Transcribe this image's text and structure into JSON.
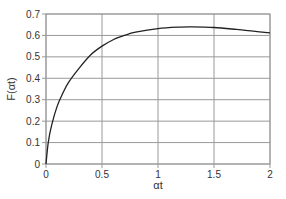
{
  "chart_data": {
    "type": "line",
    "title": "",
    "xlabel": "αt",
    "ylabel": "F(αt)",
    "xlim": [
      0,
      2
    ],
    "ylim": [
      0,
      0.7
    ],
    "xticks": [
      "0",
      "0.5",
      "1",
      "1.5",
      "2"
    ],
    "yticks": [
      "0",
      "0.1",
      "0.2",
      "0.3",
      "0.4",
      "0.5",
      "0.6",
      "0.7"
    ],
    "grid": true,
    "legend": null,
    "series": [
      {
        "name": "F(αt)",
        "color": "#222222",
        "x": [
          0,
          0.02,
          0.05,
          0.1,
          0.15,
          0.2,
          0.3,
          0.4,
          0.5,
          0.6,
          0.7,
          0.8,
          1.0,
          1.2,
          1.3,
          1.5,
          1.7,
          1.85,
          2.0
        ],
        "y": [
          0,
          0.1,
          0.18,
          0.27,
          0.33,
          0.38,
          0.45,
          0.51,
          0.55,
          0.58,
          0.6,
          0.615,
          0.632,
          0.639,
          0.64,
          0.637,
          0.628,
          0.62,
          0.612
        ]
      }
    ]
  }
}
